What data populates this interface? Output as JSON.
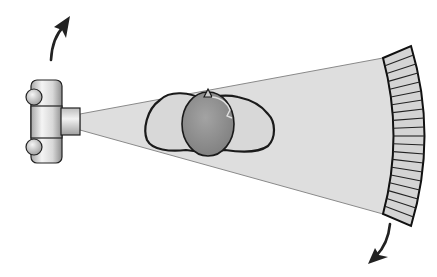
{
  "diagram": {
    "components": [
      {
        "id": "xray-tube",
        "label": "X-ray tube"
      },
      {
        "id": "fan-beam",
        "label": "Fan-shaped X-ray beam"
      },
      {
        "id": "patient-body",
        "label": "Patient cross-section"
      },
      {
        "id": "organ",
        "label": "Internal organ"
      },
      {
        "id": "detector-array",
        "label": "Curved detector array",
        "element_count": 20
      },
      {
        "id": "rotation-arrows",
        "label": "Rotation direction"
      }
    ],
    "colors": {
      "beam": "#dcdcdc",
      "beam_edge": "#8a8a8a",
      "outline": "#1a1a1a",
      "body_fill": "#d6d6d6",
      "organ_fill": "#8e8e8e",
      "detector_fill": "#d4d4d4",
      "tube_light": "#f2f2f2",
      "tube_dark": "#9a9a9a",
      "arrow": "#222222"
    }
  }
}
